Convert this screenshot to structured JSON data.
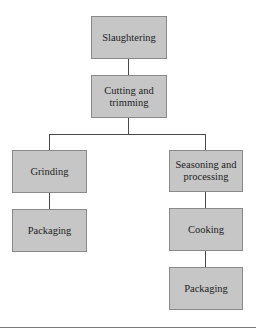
{
  "diagram": {
    "type": "process-flowchart",
    "nodes": [
      {
        "id": "slaughtering",
        "label": "Slaughtering"
      },
      {
        "id": "cutting",
        "label": "Cutting and trimming"
      },
      {
        "id": "grinding",
        "label": "Grinding"
      },
      {
        "id": "packaging_left",
        "label": "Packaging"
      },
      {
        "id": "seasoning",
        "label": "Seasoning and processing"
      },
      {
        "id": "cooking",
        "label": "Cooking"
      },
      {
        "id": "packaging_right",
        "label": "Packaging"
      }
    ],
    "edges": [
      {
        "from": "slaughtering",
        "to": "cutting"
      },
      {
        "from": "cutting",
        "to": "grinding"
      },
      {
        "from": "cutting",
        "to": "seasoning"
      },
      {
        "from": "grinding",
        "to": "packaging_left"
      },
      {
        "from": "seasoning",
        "to": "cooking"
      },
      {
        "from": "cooking",
        "to": "packaging_right"
      }
    ],
    "colors": {
      "box_fill": "#c6c6c6",
      "box_border": "#8a8a8a",
      "connector": "#4a4a4a",
      "text": "#1e1e1e"
    }
  }
}
